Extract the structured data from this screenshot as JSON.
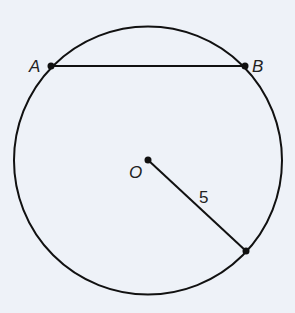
{
  "diagram": {
    "circle": {
      "cx": 148,
      "cy": 160,
      "r": 134
    },
    "points": {
      "A": {
        "label": "A",
        "x": 51,
        "y": 66
      },
      "B": {
        "label": "B",
        "x": 245,
        "y": 66
      },
      "O": {
        "label": "O",
        "x": 148,
        "y": 160
      },
      "P": {
        "x": 246,
        "y": 251
      }
    },
    "chord_label": "AB",
    "radius_label": "5",
    "colors": {
      "stroke": "#111111",
      "background": "#eef2f8"
    }
  }
}
